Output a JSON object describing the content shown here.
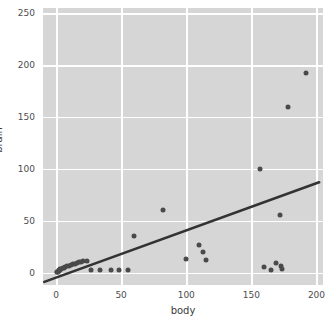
{
  "chart_data": {
    "type": "scatter",
    "title": "",
    "xlabel": "body",
    "ylabel": "brain",
    "xlim": [
      -10,
      205
    ],
    "ylim": [
      -12,
      255
    ],
    "xticks": [
      0,
      50,
      100,
      150,
      200
    ],
    "yticks": [
      0,
      50,
      100,
      150,
      200,
      250
    ],
    "grid": true,
    "legend": null,
    "colors": {
      "panel_background": "#d6d6d6",
      "gridline": "#ffffff",
      "point": "#4a4a4a",
      "fit_line": "#333333",
      "tick_text": "#4d4d4d",
      "axis_label_text": "#3b3b3b",
      "figure_background": "#ffffff"
    },
    "points": [
      {
        "x": 0.4,
        "y": 0.5
      },
      {
        "x": 1.0,
        "y": 1.0
      },
      {
        "x": 1.4,
        "y": 1.0
      },
      {
        "x": 2.0,
        "y": 2.0
      },
      {
        "x": 2.5,
        "y": 1.5
      },
      {
        "x": 3.0,
        "y": 2.5
      },
      {
        "x": 3.3,
        "y": 3.0
      },
      {
        "x": 4.0,
        "y": 3.5
      },
      {
        "x": 5.0,
        "y": 4.0
      },
      {
        "x": 6.0,
        "y": 4.5
      },
      {
        "x": 7.0,
        "y": 5.0
      },
      {
        "x": 8.5,
        "y": 6.0
      },
      {
        "x": 10.0,
        "y": 6.5
      },
      {
        "x": 11.5,
        "y": 7.0
      },
      {
        "x": 13.0,
        "y": 8.0
      },
      {
        "x": 14.5,
        "y": 8.5
      },
      {
        "x": 16.0,
        "y": 9.0
      },
      {
        "x": 17.5,
        "y": 10.0
      },
      {
        "x": 19.0,
        "y": 10.5
      },
      {
        "x": 21.0,
        "y": 11.0
      },
      {
        "x": 24.0,
        "y": 11.5
      },
      {
        "x": 27.0,
        "y": 2.0
      },
      {
        "x": 34.0,
        "y": 2.0
      },
      {
        "x": 42.0,
        "y": 2.0
      },
      {
        "x": 48.0,
        "y": 2.0
      },
      {
        "x": 55.0,
        "y": 2.0
      },
      {
        "x": 60.0,
        "y": 35.0
      },
      {
        "x": 82.0,
        "y": 60.0
      },
      {
        "x": 100.0,
        "y": 13.0
      },
      {
        "x": 110.0,
        "y": 27.0
      },
      {
        "x": 113.0,
        "y": 20.0
      },
      {
        "x": 115.0,
        "y": 12.0
      },
      {
        "x": 157.0,
        "y": 100.0
      },
      {
        "x": 160.0,
        "y": 5.0
      },
      {
        "x": 165.0,
        "y": 2.0
      },
      {
        "x": 169.0,
        "y": 9.0
      },
      {
        "x": 172.0,
        "y": 55.0
      },
      {
        "x": 173.0,
        "y": 6.0
      },
      {
        "x": 173.5,
        "y": 3.0
      },
      {
        "x": 178.0,
        "y": 160.0
      },
      {
        "x": 192.0,
        "y": 192.0
      }
    ],
    "fit_line": {
      "x0": -9.0,
      "y0": -9.0,
      "x1": 202.0,
      "y1": 87.0
    }
  }
}
